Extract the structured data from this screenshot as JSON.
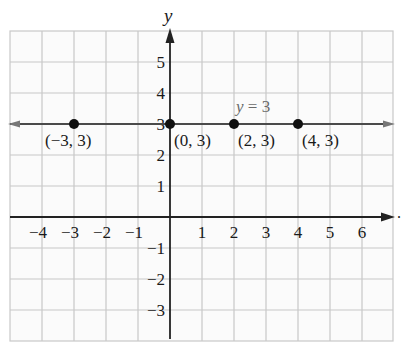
{
  "chart_data": {
    "type": "line",
    "title": "",
    "xlabel": "",
    "ylabel": "y",
    "xlim": [
      -5,
      7
    ],
    "ylim": [
      -4,
      6
    ],
    "grid": true,
    "x_ticks": [
      -4,
      -3,
      -2,
      -1,
      1,
      2,
      3,
      4,
      5,
      6
    ],
    "y_ticks": [
      5,
      4,
      3,
      2,
      1,
      -1,
      -2,
      -3
    ],
    "x_tick_labels": [
      "−4",
      "−3",
      "−2",
      "−1",
      "1",
      "2",
      "3",
      "4",
      "5",
      "6"
    ],
    "y_tick_labels": [
      "5",
      "4",
      "3",
      "2",
      "1",
      "−1",
      "−2",
      "−3"
    ],
    "series": [
      {
        "name": "y = 3",
        "kind": "horizontal-line",
        "y": 3,
        "points": [
          {
            "x": -3,
            "y": 3,
            "label": "(−3, 3)"
          },
          {
            "x": 0,
            "y": 3,
            "label": "(0, 3)"
          },
          {
            "x": 2,
            "y": 3,
            "label": "(2, 3)"
          },
          {
            "x": 4,
            "y": 3,
            "label": "(4, 3)"
          }
        ]
      }
    ],
    "annotations": [
      {
        "text": "y = 3",
        "x": 2.2,
        "y": 3.6
      }
    ],
    "colors": {
      "grid": "#c8c8c8",
      "axis": "#222222",
      "line": "#4a4a4a",
      "point": "#111111",
      "equation_label": "#6a6a6a"
    }
  },
  "labels": {
    "y_axis_name": "y",
    "equation_var": "y",
    "equation_rest": " = 3",
    "trailing_mark": "."
  }
}
